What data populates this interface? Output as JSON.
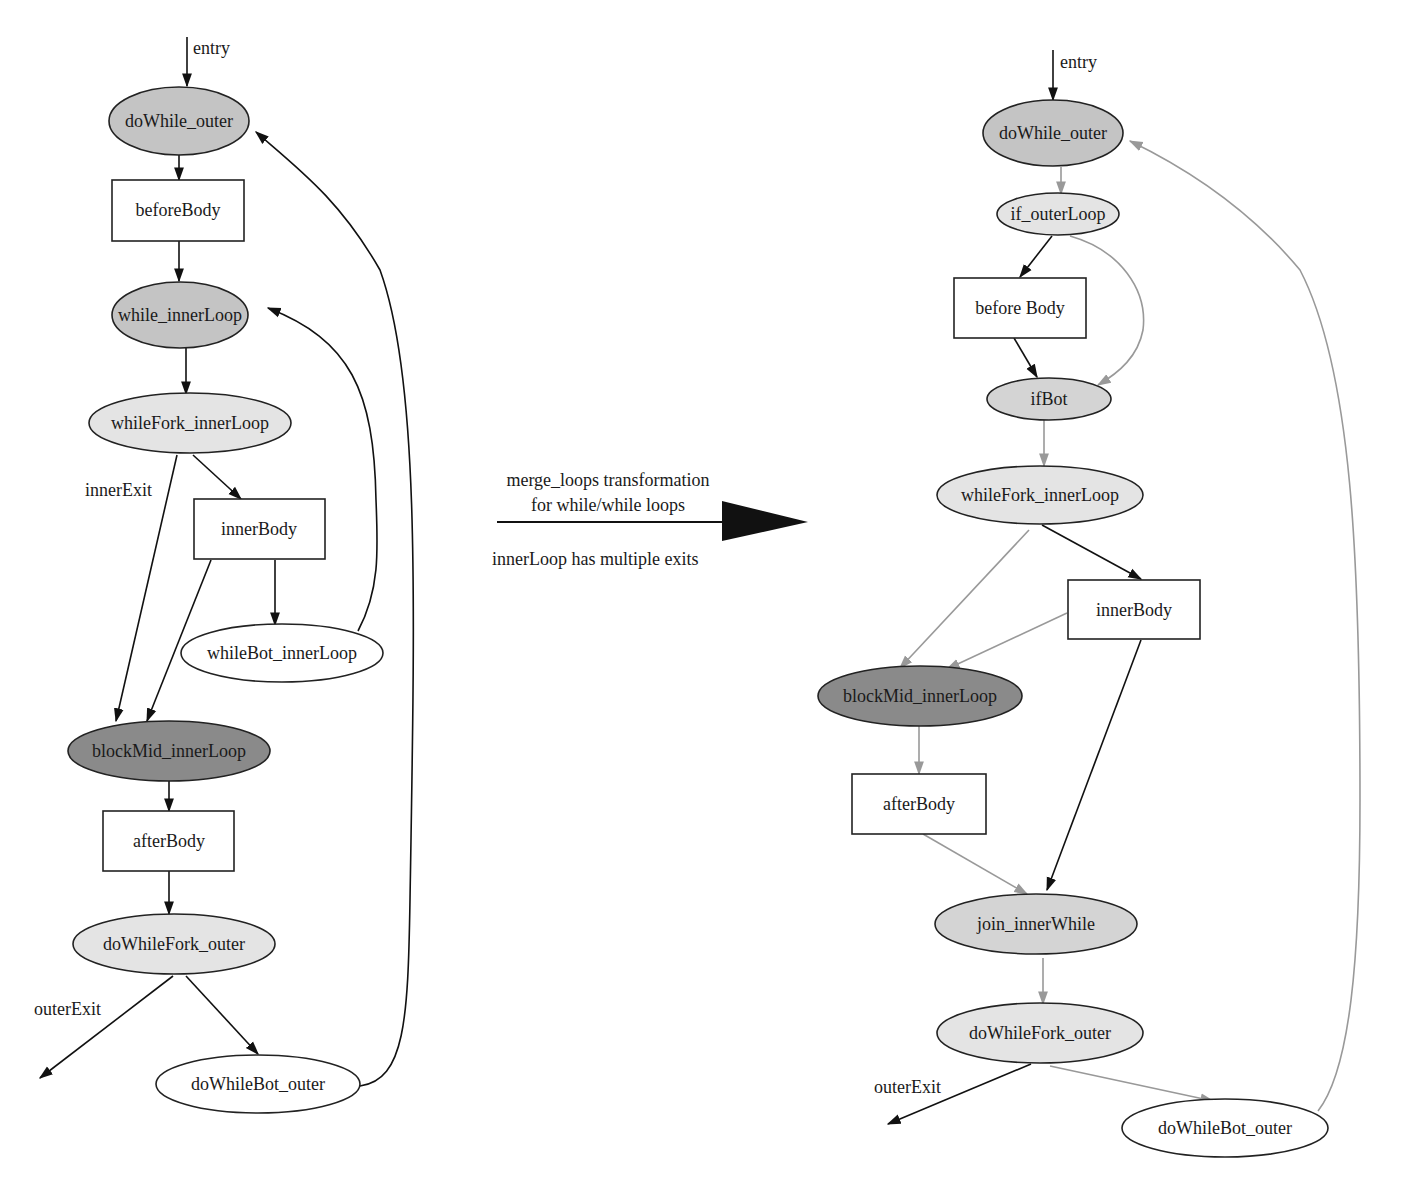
{
  "colors": {
    "node_dark": "#8a8a8a",
    "node_mid": "#c4c4c4",
    "node_light": "#e4e4e4",
    "node_white": "#ffffff",
    "edge_black": "#111111",
    "edge_gray": "#999999"
  },
  "left_graph": {
    "entry_label": "entry",
    "nodes": {
      "doWhile_outer": "doWhile_outer",
      "beforeBody": "beforeBody",
      "while_innerLoop": "while_innerLoop",
      "whileFork_innerLoop": "whileFork_innerLoop",
      "innerBody": "innerBody",
      "whileBot_innerLoop": "whileBot_innerLoop",
      "blockMid_innerLoop": "blockMid_innerLoop",
      "afterBody": "afterBody",
      "doWhileFork_outer": "doWhileFork_outer",
      "doWhileBot_outer": "doWhileBot_outer"
    },
    "edge_labels": {
      "innerExit": "innerExit",
      "outerExit": "outerExit"
    }
  },
  "transformation": {
    "line1": "merge_loops transformation",
    "line2": "for while/while loops",
    "note": "innerLoop has multiple exits"
  },
  "right_graph": {
    "entry_label": "entry",
    "nodes": {
      "doWhile_outer": "doWhile_outer",
      "if_outerLoop": "if_outerLoop",
      "beforeBody": "before Body",
      "ifBot": "ifBot",
      "whileFork_innerLoop": "whileFork_innerLoop",
      "innerBody": "innerBody",
      "blockMid_innerLoop": "blockMid_innerLoop",
      "afterBody": "afterBody",
      "join_innerWhile": "join_innerWhile",
      "doWhileFork_outer": "doWhileFork_outer",
      "doWhileBot_outer": "doWhileBot_outer"
    },
    "edge_labels": {
      "outerExit": "outerExit"
    }
  }
}
